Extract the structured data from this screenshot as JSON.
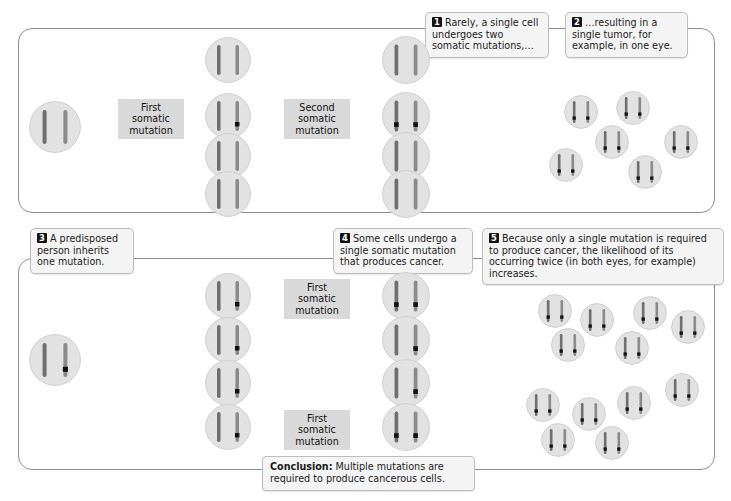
{
  "callouts": [
    {
      "id": "1",
      "number": "1",
      "text": "Rarely, a single cell undergoes two somatic mutations,…"
    },
    {
      "id": "2",
      "number": "2",
      "text": "…resulting in a single tumor, for example, in one eye."
    },
    {
      "id": "3",
      "number": "3",
      "text": "A predisposed person inherits one mutation."
    },
    {
      "id": "4",
      "number": "4",
      "text": "Some cells undergo a single somatic mutation that produces cancer."
    },
    {
      "id": "5",
      "number": "5",
      "text": "Because only a single mutation is required to produce cancer, the likelihood of its occurring twice (in both eyes, for example) increases."
    }
  ],
  "conclusion": {
    "label": "Conclusion:",
    "text": " Multiple mutations are required to produce cancerous cells."
  },
  "process_labels": {
    "first_somatic_mutation": "First somatic mutation",
    "second_somatic_mutation": "Second somatic mutation"
  },
  "panels": {
    "top": {
      "name": "sporadic-pathway",
      "progenitor": {
        "mutations": 0
      },
      "column2": [
        {
          "mutations": 0
        },
        {
          "mutations": 1
        },
        {
          "mutations": 0
        },
        {
          "mutations": 0
        }
      ],
      "column3": [
        {
          "mutations": 0
        },
        {
          "mutations": 2
        },
        {
          "mutations": 0
        },
        {
          "mutations": 0
        }
      ],
      "tumor_clusters": [
        {
          "cell_count": 6,
          "mutations": 2
        }
      ]
    },
    "bottom": {
      "name": "inherited-pathway",
      "progenitor": {
        "mutations": 1
      },
      "column2": [
        {
          "mutations": 1
        },
        {
          "mutations": 1
        },
        {
          "mutations": 1
        },
        {
          "mutations": 1
        }
      ],
      "column3": [
        {
          "mutations": 2
        },
        {
          "mutations": 1
        },
        {
          "mutations": 1
        },
        {
          "mutations": 2
        }
      ],
      "tumor_clusters": [
        {
          "cell_count": 6,
          "mutations": 2
        },
        {
          "cell_count": 6,
          "mutations": 2
        }
      ]
    }
  },
  "colors": {
    "cell_fill": "#e2e2e2",
    "cell_stroke": "#cfcfcf",
    "chromosome": "#8a8a8a",
    "chromosome_dark": "#6f6f6f",
    "mutation_marker": "#111111",
    "panel_border": "#8d8d8d",
    "callout_bg": "#f4f4f4",
    "callout_border": "#bdbdbd",
    "process_box_bg": "#d9d9d9",
    "arrow": "#3a3a3a",
    "leader_line": "#9a9a9a"
  }
}
